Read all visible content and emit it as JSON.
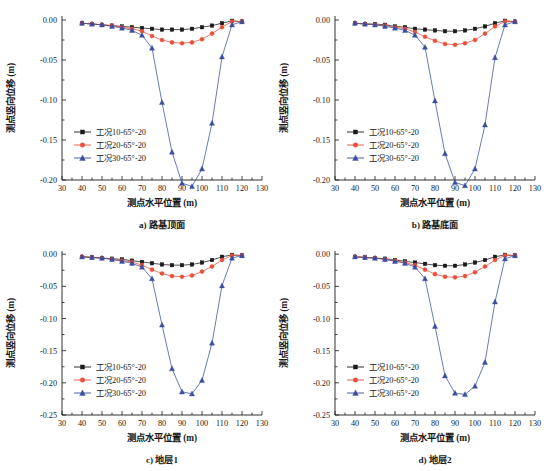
{
  "figure": {
    "background": "#ffffff",
    "axis_color": "#1a1a1a"
  },
  "common": {
    "xlabel": "测点水平位置 (m)",
    "ylabel": "测点竖向位移 (m)",
    "xlim": [
      30,
      130
    ],
    "xticks": [
      30,
      40,
      50,
      60,
      70,
      80,
      90,
      100,
      110,
      120,
      130
    ],
    "xticklabels": [
      "30",
      "40",
      "50",
      "60",
      "70",
      "80",
      "90",
      "100",
      "110",
      "120",
      "130"
    ],
    "legend_labels": [
      "工况10-65°-20",
      "工况20-65°-20",
      "工况30-65°-20"
    ],
    "series_colors": [
      "#1a1a1a",
      "#e8503a",
      "#3b4d9e"
    ],
    "series_markers": [
      "square",
      "circle",
      "triangle"
    ],
    "x": [
      40,
      45,
      50,
      55,
      60,
      65,
      70,
      75,
      80,
      85,
      90,
      95,
      100,
      105,
      110,
      115,
      120
    ]
  },
  "chart_data": [
    {
      "id": "a",
      "type": "line",
      "caption": "a) 路基顶面",
      "title": "",
      "xlabel": "测点水平位置 (m)",
      "ylabel": "测点竖向位移 (m)",
      "xlim": [
        30,
        130
      ],
      "ylim": [
        -0.2,
        0.005
      ],
      "yticks": [
        0.0,
        -0.05,
        -0.1,
        -0.15,
        -0.2
      ],
      "yticklabels": [
        "0.00",
        "-0.05",
        "-0.10",
        "-0.15",
        "-0.20"
      ],
      "grid": false,
      "legend_position": "lower-left",
      "x": [
        40,
        45,
        50,
        55,
        60,
        65,
        70,
        75,
        80,
        85,
        90,
        95,
        100,
        105,
        110,
        115,
        120
      ],
      "series": [
        {
          "name": "工况10-65°-20",
          "color": "#1a1a1a",
          "marker": "square",
          "values": [
            -0.004,
            -0.005,
            -0.006,
            -0.007,
            -0.008,
            -0.009,
            -0.01,
            -0.011,
            -0.012,
            -0.012,
            -0.012,
            -0.011,
            -0.009,
            -0.007,
            -0.004,
            -0.001,
            -0.002
          ]
        },
        {
          "name": "工况20-65°-20",
          "color": "#e8503a",
          "marker": "circle",
          "values": [
            -0.004,
            -0.005,
            -0.006,
            -0.007,
            -0.009,
            -0.011,
            -0.014,
            -0.02,
            -0.025,
            -0.028,
            -0.029,
            -0.028,
            -0.024,
            -0.017,
            -0.009,
            -0.002,
            -0.002
          ]
        },
        {
          "name": "工况30-65°-20",
          "color": "#3b4d9e",
          "marker": "triangle",
          "values": [
            -0.004,
            -0.005,
            -0.006,
            -0.008,
            -0.01,
            -0.013,
            -0.019,
            -0.035,
            -0.103,
            -0.165,
            -0.204,
            -0.208,
            -0.186,
            -0.129,
            -0.046,
            -0.006,
            -0.002
          ]
        }
      ]
    },
    {
      "id": "b",
      "type": "line",
      "caption": "b) 路基底面",
      "title": "",
      "xlabel": "测点水平位置 (m)",
      "ylabel": "测点竖向位移 (m)",
      "xlim": [
        30,
        130
      ],
      "ylim": [
        -0.2,
        0.005
      ],
      "yticks": [
        0.0,
        -0.05,
        -0.1,
        -0.15,
        -0.2
      ],
      "yticklabels": [
        "0.00",
        "-0.05",
        "-0.10",
        "-0.15",
        "-0.20"
      ],
      "grid": false,
      "legend_position": "lower-left",
      "x": [
        40,
        45,
        50,
        55,
        60,
        65,
        70,
        75,
        80,
        85,
        90,
        95,
        100,
        105,
        110,
        115,
        120
      ],
      "series": [
        {
          "name": "工况10-65°-20",
          "color": "#1a1a1a",
          "marker": "square",
          "values": [
            -0.004,
            -0.005,
            -0.005,
            -0.006,
            -0.008,
            -0.009,
            -0.011,
            -0.012,
            -0.013,
            -0.014,
            -0.014,
            -0.013,
            -0.011,
            -0.008,
            -0.004,
            -0.001,
            -0.002
          ]
        },
        {
          "name": "工况20-65°-20",
          "color": "#e8503a",
          "marker": "circle",
          "values": [
            -0.004,
            -0.005,
            -0.006,
            -0.007,
            -0.009,
            -0.011,
            -0.015,
            -0.021,
            -0.026,
            -0.03,
            -0.031,
            -0.029,
            -0.025,
            -0.017,
            -0.008,
            -0.002,
            -0.002
          ]
        },
        {
          "name": "工况30-65°-20",
          "color": "#3b4d9e",
          "marker": "triangle",
          "values": [
            -0.004,
            -0.005,
            -0.006,
            -0.008,
            -0.01,
            -0.013,
            -0.019,
            -0.034,
            -0.101,
            -0.167,
            -0.203,
            -0.207,
            -0.186,
            -0.131,
            -0.047,
            -0.006,
            -0.002
          ]
        }
      ]
    },
    {
      "id": "c",
      "type": "line",
      "caption": "c) 地层1",
      "title": "",
      "xlabel": "测点水平位置 (m)",
      "ylabel": "测点竖向位移 (m)",
      "xlim": [
        30,
        130
      ],
      "ylim": [
        -0.25,
        0.005
      ],
      "yticks": [
        0.0,
        -0.05,
        -0.1,
        -0.15,
        -0.2,
        -0.25
      ],
      "yticklabels": [
        "0.00",
        "-0.05",
        "-0.10",
        "-0.15",
        "-0.20",
        "-0.25"
      ],
      "grid": false,
      "legend_position": "lower-left",
      "x": [
        40,
        45,
        50,
        55,
        60,
        65,
        70,
        75,
        80,
        85,
        90,
        95,
        100,
        105,
        110,
        115,
        120
      ],
      "series": [
        {
          "name": "工况10-65°-20",
          "color": "#1a1a1a",
          "marker": "square",
          "values": [
            -0.004,
            -0.005,
            -0.006,
            -0.007,
            -0.008,
            -0.01,
            -0.012,
            -0.014,
            -0.016,
            -0.017,
            -0.017,
            -0.016,
            -0.013,
            -0.009,
            -0.004,
            -0.001,
            -0.002
          ]
        },
        {
          "name": "工况20-65°-20",
          "color": "#e8503a",
          "marker": "circle",
          "values": [
            -0.004,
            -0.005,
            -0.006,
            -0.008,
            -0.01,
            -0.012,
            -0.017,
            -0.024,
            -0.03,
            -0.034,
            -0.035,
            -0.033,
            -0.027,
            -0.019,
            -0.009,
            -0.002,
            -0.002
          ]
        },
        {
          "name": "工况30-65°-20",
          "color": "#3b4d9e",
          "marker": "triangle",
          "values": [
            -0.004,
            -0.005,
            -0.006,
            -0.008,
            -0.011,
            -0.014,
            -0.02,
            -0.038,
            -0.11,
            -0.178,
            -0.214,
            -0.217,
            -0.196,
            -0.138,
            -0.049,
            -0.006,
            -0.002
          ]
        }
      ]
    },
    {
      "id": "d",
      "type": "line",
      "caption": "d) 地层2",
      "title": "",
      "xlabel": "测点水平位置 (m)",
      "ylabel": "测点竖向位移 (m)",
      "xlim": [
        30,
        130
      ],
      "ylim": [
        -0.25,
        0.005
      ],
      "yticks": [
        0.0,
        -0.05,
        -0.1,
        -0.15,
        -0.2,
        -0.25
      ],
      "yticklabels": [
        "0.00",
        "-0.05",
        "-0.10",
        "-0.15",
        "-0.20",
        "-0.25"
      ],
      "grid": false,
      "legend_position": "lower-left",
      "x": [
        40,
        45,
        50,
        55,
        60,
        65,
        70,
        75,
        80,
        85,
        90,
        95,
        100,
        105,
        110,
        115,
        120
      ],
      "series": [
        {
          "name": "工况10-65°-20",
          "color": "#1a1a1a",
          "marker": "square",
          "values": [
            -0.004,
            -0.005,
            -0.006,
            -0.007,
            -0.009,
            -0.011,
            -0.013,
            -0.015,
            -0.017,
            -0.018,
            -0.018,
            -0.016,
            -0.013,
            -0.009,
            -0.004,
            -0.001,
            -0.002
          ]
        },
        {
          "name": "工况20-65°-20",
          "color": "#e8503a",
          "marker": "circle",
          "values": [
            -0.004,
            -0.005,
            -0.006,
            -0.008,
            -0.01,
            -0.013,
            -0.017,
            -0.024,
            -0.031,
            -0.035,
            -0.036,
            -0.034,
            -0.028,
            -0.019,
            -0.009,
            -0.002,
            -0.002
          ]
        },
        {
          "name": "工况30-65°-20",
          "color": "#3b4d9e",
          "marker": "triangle",
          "values": [
            -0.004,
            -0.005,
            -0.006,
            -0.008,
            -0.011,
            -0.014,
            -0.02,
            -0.038,
            -0.112,
            -0.189,
            -0.216,
            -0.218,
            -0.205,
            -0.168,
            -0.074,
            -0.007,
            -0.002
          ]
        }
      ]
    }
  ]
}
